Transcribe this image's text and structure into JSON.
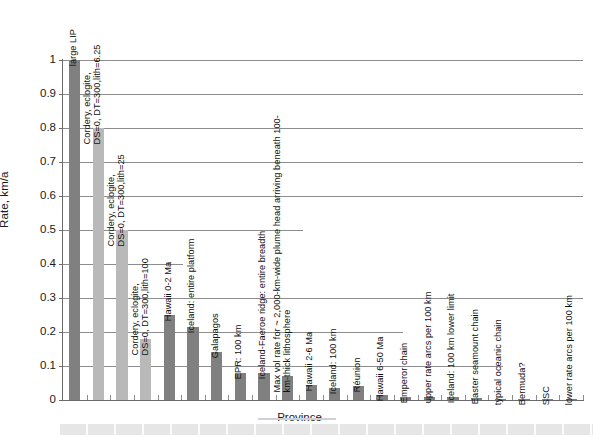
{
  "chart_data": {
    "type": "bar",
    "title": "",
    "subtitle": "",
    "xlabel": "Province",
    "ylabel": "Rate, km/a",
    "ylim": [
      0,
      1
    ],
    "yticks": [
      "0",
      "0.1",
      "0.2",
      "0.3",
      "0.4",
      "0.5",
      "0.6",
      "0.7",
      "0.8",
      "0.9",
      "1"
    ],
    "ytick_values": [
      0,
      0.1,
      0.2,
      0.3,
      0.4,
      0.5,
      0.6,
      0.7,
      0.8,
      0.9,
      1.0
    ],
    "grid": "horizontal, partial-width lines",
    "legend": "none",
    "categories": [
      "large LIP",
      "Cordery, eclogite,\nDS=0, DT=300,lith=6.25",
      "Cordery, eclogite,\nDS=0, DT=300,lith=25",
      "Cordery, eclogite,\nDS=0, DT=300,lith=100",
      "Hawaii 0-2 Ma",
      "Iceland: entire platform",
      "Galapagos",
      "EPR: 100 km",
      "Iceland-Faeroe ridge: entire breadth",
      "Max vol rate for ~ 2,000-km-wide plume head arriving beneath 100-\nkm-thick lithosphere",
      "Hawaii 2-6 Ma",
      "Iceland: 100 km",
      "Réunion",
      "Hawaii 6-50 Ma",
      "Emperor chain",
      "upper rate arcs per 100 km",
      "Iceland: 100 km lower limit",
      "Easter seamount chain",
      "typical oceanic chain",
      "Bermuda?",
      "SSC",
      "lower rate arcs per 100 km"
    ],
    "values": [
      1.0,
      0.8,
      0.5,
      0.18,
      0.25,
      0.215,
      0.14,
      0.08,
      0.08,
      0.07,
      0.045,
      0.035,
      0.04,
      0.015,
      0.008,
      0.008,
      0.008,
      0.006,
      0.004,
      0.004,
      0.002,
      0.002
    ],
    "bar_colors": [
      "dark",
      "light",
      "light",
      "light",
      "dark",
      "dark",
      "dark",
      "dark",
      "dark",
      "dark",
      "dark",
      "dark",
      "dark",
      "dark",
      "dark",
      "dark",
      "dark",
      "dark",
      "dark",
      "dark",
      "dark",
      "dark"
    ],
    "colors": {
      "dark_bar": "#808080",
      "light_bar": "#b9b9b9",
      "gridline": "#8d8d8d",
      "axis": "#6b6b6b",
      "text": "#111111",
      "background": "#ffffff",
      "bottom_band": "#e6e6e6"
    },
    "gridline_extents_px": [
      0,
      440,
      340,
      520,
      120,
      240,
      700,
      840,
      620,
      980,
      1000
    ]
  }
}
